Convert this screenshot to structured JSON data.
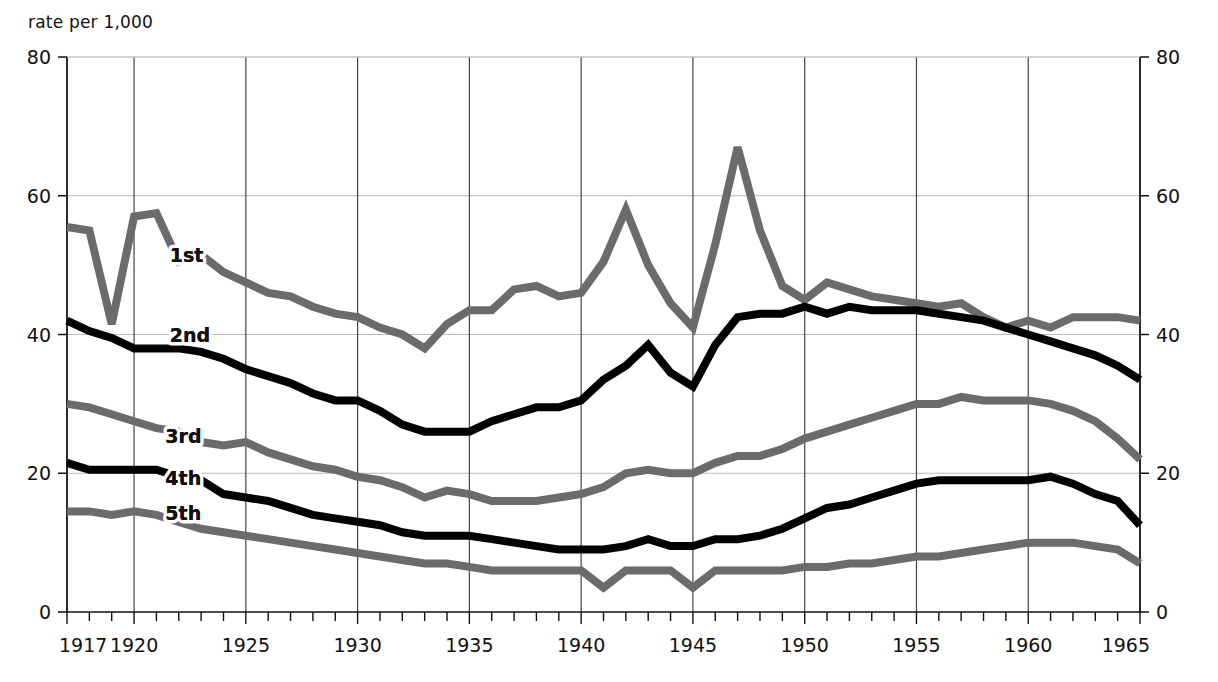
{
  "chart_data": {
    "type": "line",
    "title": "",
    "subtitle": "",
    "ylabel": "rate per 1,000",
    "xlabel": "",
    "ylim": [
      0,
      80
    ],
    "xlim": [
      1917,
      1965
    ],
    "ytick_labels": [
      "0",
      "20",
      "40",
      "60",
      "80"
    ],
    "ytick_values": [
      0,
      20,
      40,
      60,
      80
    ],
    "ytick_labels_right": [
      "0",
      "20",
      "40",
      "60",
      "80"
    ],
    "xtick_labels": [
      "1917",
      "1920",
      "1925",
      "1930",
      "1935",
      "1940",
      "1945",
      "1950",
      "1955",
      "1960",
      "1965"
    ],
    "xtick_values": [
      1917,
      1920,
      1925,
      1930,
      1935,
      1940,
      1945,
      1950,
      1955,
      1960,
      1965
    ],
    "minor_xticks_every": 1,
    "grid": "major-xy",
    "legend_position": "inline-annotations",
    "x": [
      1917,
      1918,
      1919,
      1920,
      1921,
      1922,
      1923,
      1924,
      1925,
      1926,
      1927,
      1928,
      1929,
      1930,
      1931,
      1932,
      1933,
      1934,
      1935,
      1936,
      1937,
      1938,
      1939,
      1940,
      1941,
      1942,
      1943,
      1944,
      1945,
      1946,
      1947,
      1948,
      1949,
      1950,
      1951,
      1952,
      1953,
      1954,
      1955,
      1956,
      1957,
      1958,
      1959,
      1960,
      1961,
      1962,
      1963,
      1964,
      1965
    ],
    "series": [
      {
        "name": "1st",
        "label": "1st",
        "color": "#6b6b6b",
        "values": [
          55.5,
          55.0,
          41.5,
          57.0,
          57.5,
          50.5,
          51.5,
          49.0,
          47.5,
          46.0,
          45.5,
          44.0,
          43.0,
          42.5,
          41.0,
          40.0,
          38.0,
          41.5,
          43.5,
          43.5,
          46.5,
          47.0,
          45.5,
          46.0,
          50.5,
          58.0,
          50.0,
          44.5,
          41.0,
          53.0,
          67.0,
          55.0,
          47.0,
          45.0,
          47.5,
          46.5,
          45.5,
          45.0,
          44.5,
          44.0,
          44.5,
          42.5,
          41.0,
          42.0,
          41.0,
          42.5,
          42.5,
          42.5,
          42.0
        ]
      },
      {
        "name": "2nd",
        "label": "2nd",
        "color": "#000000",
        "values": [
          42.0,
          40.5,
          39.5,
          38.0,
          38.0,
          38.0,
          37.5,
          36.5,
          35.0,
          34.0,
          33.0,
          31.5,
          30.5,
          30.5,
          29.0,
          27.0,
          26.0,
          26.0,
          26.0,
          27.5,
          28.5,
          29.5,
          29.5,
          30.5,
          33.5,
          35.5,
          38.5,
          34.5,
          32.5,
          38.5,
          42.5,
          43.0,
          43.0,
          44.0,
          43.0,
          44.0,
          43.5,
          43.5,
          43.5,
          43.0,
          42.5,
          42.0,
          41.0,
          40.0,
          39.0,
          38.0,
          37.0,
          35.5,
          33.5
        ]
      },
      {
        "name": "3rd",
        "label": "3rd",
        "color": "#6b6b6b",
        "values": [
          30.0,
          29.5,
          28.5,
          27.5,
          26.5,
          26.0,
          24.5,
          24.0,
          24.5,
          23.0,
          22.0,
          21.0,
          20.5,
          19.5,
          19.0,
          18.0,
          16.5,
          17.5,
          17.0,
          16.0,
          16.0,
          16.0,
          16.5,
          17.0,
          18.0,
          20.0,
          20.5,
          20.0,
          20.0,
          21.5,
          22.5,
          22.5,
          23.5,
          25.0,
          26.0,
          27.0,
          28.0,
          29.0,
          30.0,
          30.0,
          31.0,
          30.5,
          30.5,
          30.5,
          30.0,
          29.0,
          27.5,
          25.0,
          22.0
        ]
      },
      {
        "name": "4th",
        "label": "4th",
        "color": "#000000",
        "values": [
          21.5,
          20.5,
          20.5,
          20.5,
          20.5,
          19.5,
          19.0,
          17.0,
          16.5,
          16.0,
          15.0,
          14.0,
          13.5,
          13.0,
          12.5,
          11.5,
          11.0,
          11.0,
          11.0,
          10.5,
          10.0,
          9.5,
          9.0,
          9.0,
          9.0,
          9.5,
          10.5,
          9.5,
          9.5,
          10.5,
          10.5,
          11.0,
          12.0,
          13.5,
          15.0,
          15.5,
          16.5,
          17.5,
          18.5,
          19.0,
          19.0,
          19.0,
          19.0,
          19.0,
          19.5,
          18.5,
          17.0,
          16.0,
          12.5
        ]
      },
      {
        "name": "5th",
        "label": "5th",
        "color": "#6b6b6b",
        "values": [
          14.5,
          14.5,
          14.0,
          14.5,
          14.0,
          13.0,
          12.0,
          11.5,
          11.0,
          10.5,
          10.0,
          9.5,
          9.0,
          8.5,
          8.0,
          7.5,
          7.0,
          7.0,
          6.5,
          6.0,
          6.0,
          6.0,
          6.0,
          6.0,
          3.5,
          6.0,
          6.0,
          6.0,
          3.5,
          6.0,
          6.0,
          6.0,
          6.0,
          6.5,
          6.5,
          7.0,
          7.0,
          7.5,
          8.0,
          8.0,
          8.5,
          9.0,
          9.5,
          10.0,
          10.0,
          10.0,
          9.5,
          9.0,
          7.0
        ]
      }
    ],
    "annotations": [
      {
        "text": "1st",
        "x": 1921.6,
        "y": 51.5
      },
      {
        "text": "2nd",
        "x": 1921.6,
        "y": 40.0
      },
      {
        "text": "3rd",
        "x": 1921.4,
        "y": 25.3
      },
      {
        "text": "4th",
        "x": 1921.4,
        "y": 19.3
      },
      {
        "text": "5th",
        "x": 1921.4,
        "y": 14.3
      }
    ]
  }
}
